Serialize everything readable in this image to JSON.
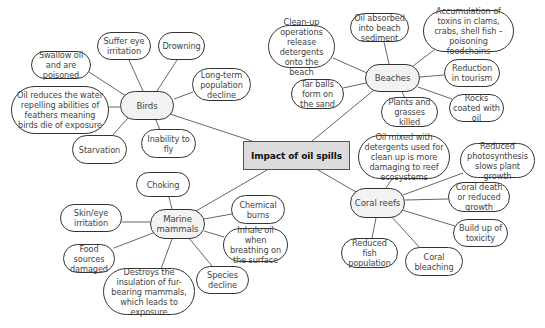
{
  "diagram": {
    "type": "mind-map",
    "center": {
      "id": "center",
      "label": "Impact of oil spills",
      "x": 243,
      "y": 141,
      "w": 107,
      "h": 29
    },
    "hubs": [
      {
        "id": "birds",
        "label": "Birds",
        "x": 120,
        "y": 91,
        "w": 54,
        "h": 29
      },
      {
        "id": "beaches",
        "label": "Beaches",
        "x": 365,
        "y": 64,
        "w": 55,
        "h": 28
      },
      {
        "id": "marine",
        "label": "Marine mammals",
        "x": 150,
        "y": 209,
        "w": 55,
        "h": 30
      },
      {
        "id": "coral",
        "label": "Coral reefs",
        "x": 350,
        "y": 188,
        "w": 55,
        "h": 30
      }
    ],
    "leaves": [
      {
        "id": "b1",
        "hub": "birds",
        "label": "Swallow oil and are poisoned",
        "x": 31,
        "y": 51,
        "w": 60,
        "h": 28
      },
      {
        "id": "b2",
        "hub": "birds",
        "label": "Suffer eye irritation",
        "x": 97,
        "y": 32,
        "w": 54,
        "h": 28
      },
      {
        "id": "b3",
        "hub": "birds",
        "label": "Drowning",
        "x": 158,
        "y": 32,
        "w": 47,
        "h": 28
      },
      {
        "id": "b4",
        "hub": "birds",
        "label": "Long-term population decline",
        "x": 192,
        "y": 68,
        "w": 59,
        "h": 33
      },
      {
        "id": "b5",
        "hub": "birds",
        "label": "Oil reduces the water repelling abilities of feathers meaning birds die of exposure",
        "x": 11,
        "y": 86,
        "w": 98,
        "h": 48
      },
      {
        "id": "b6",
        "hub": "birds",
        "label": "Starvation",
        "x": 72,
        "y": 135,
        "w": 55,
        "h": 29
      },
      {
        "id": "b7",
        "hub": "birds",
        "label": "Inability to fly",
        "x": 141,
        "y": 129,
        "w": 55,
        "h": 29
      },
      {
        "id": "be1",
        "hub": "beaches",
        "label": "Clean-up operations release detergents onto the beach",
        "x": 268,
        "y": 25,
        "w": 67,
        "h": 43
      },
      {
        "id": "be2",
        "hub": "beaches",
        "label": "Oil absorbed into beach sediment",
        "x": 350,
        "y": 13,
        "w": 59,
        "h": 29
      },
      {
        "id": "be3",
        "hub": "beaches",
        "label": "Accumulation of toxins in clams, crabs, shell fish – poisoning foodchains",
        "x": 423,
        "y": 10,
        "w": 91,
        "h": 42
      },
      {
        "id": "be4",
        "hub": "beaches",
        "label": "Reduction in tourism",
        "x": 444,
        "y": 59,
        "w": 56,
        "h": 28
      },
      {
        "id": "be5",
        "hub": "beaches",
        "label": "Tar balls form on the sand",
        "x": 291,
        "y": 79,
        "w": 53,
        "h": 30
      },
      {
        "id": "be6",
        "hub": "beaches",
        "label": "Plants and grasses killed",
        "x": 381,
        "y": 97,
        "w": 57,
        "h": 30
      },
      {
        "id": "be7",
        "hub": "beaches",
        "label": "Rocks coated with oil",
        "x": 449,
        "y": 94,
        "w": 55,
        "h": 28
      },
      {
        "id": "m1",
        "hub": "marine",
        "label": "Choking",
        "x": 136,
        "y": 172,
        "w": 54,
        "h": 25
      },
      {
        "id": "m2",
        "hub": "marine",
        "label": "Skin/eye irritation",
        "x": 60,
        "y": 204,
        "w": 62,
        "h": 28
      },
      {
        "id": "m3",
        "hub": "marine",
        "label": "Chemical burns",
        "x": 231,
        "y": 195,
        "w": 54,
        "h": 29
      },
      {
        "id": "m4",
        "hub": "marine",
        "label": "Inhale oil when breathing on the surface",
        "x": 223,
        "y": 228,
        "w": 65,
        "h": 34
      },
      {
        "id": "m5",
        "hub": "marine",
        "label": "Food sources damaged",
        "x": 63,
        "y": 244,
        "w": 52,
        "h": 29
      },
      {
        "id": "m6",
        "hub": "marine",
        "label": "Destroys the insulation of fur-bearing mammals, which leads to exposure",
        "x": 103,
        "y": 268,
        "w": 92,
        "h": 47
      },
      {
        "id": "m7",
        "hub": "marine",
        "label": "Species decline",
        "x": 196,
        "y": 266,
        "w": 53,
        "h": 28
      },
      {
        "id": "c1",
        "hub": "coral",
        "label": "Oil mixed with detergents used for clean up is more damaging to reef ecosystems",
        "x": 358,
        "y": 135,
        "w": 92,
        "h": 44
      },
      {
        "id": "c2",
        "hub": "coral",
        "label": "Reduced photosynthesis slows plant growth",
        "x": 460,
        "y": 143,
        "w": 75,
        "h": 35
      },
      {
        "id": "c3",
        "hub": "coral",
        "label": "Coral death or reduced growth",
        "x": 448,
        "y": 182,
        "w": 62,
        "h": 30
      },
      {
        "id": "c4",
        "hub": "coral",
        "label": "Build up of toxicity",
        "x": 453,
        "y": 219,
        "w": 55,
        "h": 28
      },
      {
        "id": "c5",
        "hub": "coral",
        "label": "Reduced fish population",
        "x": 341,
        "y": 238,
        "w": 57,
        "h": 30
      },
      {
        "id": "c6",
        "hub": "coral",
        "label": "Coral bleaching",
        "x": 405,
        "y": 247,
        "w": 58,
        "h": 29
      }
    ],
    "connectors": [
      {
        "from": "center",
        "to": "birds",
        "x1": 252,
        "y1": 141,
        "x2": 170,
        "y2": 114
      },
      {
        "from": "center",
        "to": "beaches",
        "x1": 312,
        "y1": 141,
        "x2": 374,
        "y2": 90
      },
      {
        "from": "center",
        "to": "marine",
        "x1": 267,
        "y1": 170,
        "x2": 196,
        "y2": 211
      },
      {
        "from": "center",
        "to": "coral",
        "x1": 318,
        "y1": 170,
        "x2": 356,
        "y2": 192
      },
      {
        "from": "birds",
        "to": "b1",
        "x1": 126,
        "y1": 96,
        "x2": 89,
        "y2": 72
      },
      {
        "from": "birds",
        "to": "b2",
        "x1": 143,
        "y1": 91,
        "x2": 129,
        "y2": 60
      },
      {
        "from": "birds",
        "to": "b3",
        "x1": 157,
        "y1": 91,
        "x2": 177,
        "y2": 60
      },
      {
        "from": "birds",
        "to": "b4",
        "x1": 174,
        "y1": 99,
        "x2": 193,
        "y2": 92
      },
      {
        "from": "birds",
        "to": "b5",
        "x1": 120,
        "y1": 107,
        "x2": 109,
        "y2": 107
      },
      {
        "from": "birds",
        "to": "b6",
        "x1": 128,
        "y1": 118,
        "x2": 112,
        "y2": 136
      },
      {
        "from": "birds",
        "to": "b7",
        "x1": 156,
        "y1": 120,
        "x2": 160,
        "y2": 130
      },
      {
        "from": "beaches",
        "to": "be1",
        "x1": 367,
        "y1": 73,
        "x2": 333,
        "y2": 58
      },
      {
        "from": "beaches",
        "to": "be2",
        "x1": 389,
        "y1": 64,
        "x2": 384,
        "y2": 42
      },
      {
        "from": "beaches",
        "to": "be3",
        "x1": 413,
        "y1": 66,
        "x2": 434,
        "y2": 50
      },
      {
        "from": "beaches",
        "to": "be4",
        "x1": 420,
        "y1": 77,
        "x2": 444,
        "y2": 75
      },
      {
        "from": "beaches",
        "to": "be5",
        "x1": 366,
        "y1": 83,
        "x2": 343,
        "y2": 88
      },
      {
        "from": "beaches",
        "to": "be6",
        "x1": 402,
        "y1": 92,
        "x2": 405,
        "y2": 98
      },
      {
        "from": "beaches",
        "to": "be7",
        "x1": 418,
        "y1": 87,
        "x2": 452,
        "y2": 99
      },
      {
        "from": "marine",
        "to": "m1",
        "x1": 172,
        "y1": 209,
        "x2": 169,
        "y2": 197
      },
      {
        "from": "marine",
        "to": "m2",
        "x1": 150,
        "y1": 222,
        "x2": 122,
        "y2": 222
      },
      {
        "from": "marine",
        "to": "m3",
        "x1": 204,
        "y1": 219,
        "x2": 232,
        "y2": 214
      },
      {
        "from": "marine",
        "to": "m4",
        "x1": 204,
        "y1": 231,
        "x2": 224,
        "y2": 237
      },
      {
        "from": "marine",
        "to": "m5",
        "x1": 153,
        "y1": 233,
        "x2": 114,
        "y2": 248
      },
      {
        "from": "marine",
        "to": "m6",
        "x1": 172,
        "y1": 239,
        "x2": 161,
        "y2": 269
      },
      {
        "from": "marine",
        "to": "m7",
        "x1": 188,
        "y1": 237,
        "x2": 212,
        "y2": 266
      },
      {
        "from": "coral",
        "to": "c1",
        "x1": 386,
        "y1": 188,
        "x2": 392,
        "y2": 179
      },
      {
        "from": "coral",
        "to": "c2",
        "x1": 403,
        "y1": 195,
        "x2": 463,
        "y2": 173
      },
      {
        "from": "coral",
        "to": "c3",
        "x1": 405,
        "y1": 200,
        "x2": 448,
        "y2": 199
      },
      {
        "from": "coral",
        "to": "c4",
        "x1": 402,
        "y1": 210,
        "x2": 455,
        "y2": 226
      },
      {
        "from": "coral",
        "to": "c5",
        "x1": 376,
        "y1": 218,
        "x2": 372,
        "y2": 238
      },
      {
        "from": "coral",
        "to": "c6",
        "x1": 391,
        "y1": 216,
        "x2": 420,
        "y2": 248
      }
    ]
  }
}
